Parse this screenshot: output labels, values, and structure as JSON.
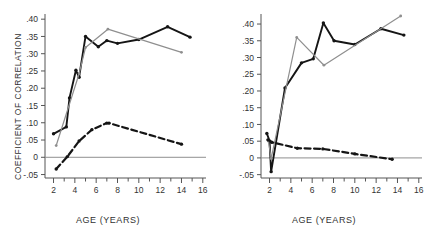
{
  "figure": {
    "panels": [
      {
        "id": "left",
        "name": "left-panel",
        "xlabel": "AGE (YEARS)",
        "ylabel": "COEFFICIENT OF CORRELATION",
        "xticks": [
          2,
          4,
          6,
          8,
          10,
          12,
          14,
          16
        ],
        "xtick_labels": [
          "2",
          "4",
          "6",
          "8",
          "10",
          "12",
          "14",
          "16"
        ],
        "yticks": [
          -0.05,
          0,
          0.05,
          0.1,
          0.15,
          0.2,
          0.25,
          0.3,
          0.35,
          0.4
        ],
        "ytick_labels": [
          "-.05",
          "0",
          ".05",
          ".10",
          ".15",
          ".20",
          ".25",
          ".30",
          ".35",
          ".40"
        ],
        "xlim": [
          1.2,
          16.3
        ],
        "ylim": [
          -0.06,
          0.415
        ]
      },
      {
        "id": "right",
        "name": "right-panel",
        "xlabel": "AGE (YEARS)",
        "ylabel": "",
        "xticks": [
          2,
          4,
          6,
          8,
          10,
          12,
          14,
          16
        ],
        "xtick_labels": [
          "2",
          "4",
          "6",
          "8",
          "10",
          "12",
          "14",
          "16"
        ],
        "yticks": [
          -0.05,
          0,
          0.05,
          0.1,
          0.15,
          0.2,
          0.25,
          0.3,
          0.35,
          0.4
        ],
        "ytick_labels": [
          "-.05",
          "0",
          ".05",
          ".10",
          ".15",
          ".20",
          ".25",
          ".30",
          ".35",
          ".40"
        ],
        "xlim": [
          1.2,
          16.3
        ],
        "ylim": [
          -0.06,
          0.43
        ]
      }
    ]
  },
  "chart_data": [
    {
      "type": "line",
      "panel": "left",
      "title": "",
      "xlabel": "AGE (YEARS)",
      "ylabel": "COEFFICIENT OF CORRELATION",
      "xlim": [
        1.2,
        16.3
      ],
      "ylim": [
        -0.06,
        0.415
      ],
      "grid": false,
      "legend": "none",
      "zero_line": true,
      "series": [
        {
          "name": "black-solid",
          "style": "solid",
          "color": "#151515",
          "markers": true,
          "x": [
            2.0,
            3.2,
            3.5,
            4.1,
            4.4,
            5.0,
            6.2,
            7.0,
            8.0,
            10.0,
            12.7,
            14.8
          ],
          "y": [
            0.068,
            0.088,
            0.172,
            0.252,
            0.232,
            0.35,
            0.32,
            0.338,
            0.33,
            0.341,
            0.378,
            0.348
          ]
        },
        {
          "name": "gray-solid",
          "style": "solid",
          "color": "#8f8f8f",
          "markers": true,
          "x": [
            2.25,
            4.4,
            5.0,
            7.1,
            14.0
          ],
          "y": [
            0.034,
            0.242,
            0.318,
            0.371,
            0.304
          ]
        },
        {
          "name": "black-dashed",
          "style": "dashed",
          "color": "#151515",
          "markers": true,
          "x": [
            2.25,
            3.3,
            4.4,
            5.6,
            7.0,
            7.2,
            14.0
          ],
          "y": [
            -0.034,
            0.002,
            0.047,
            0.08,
            0.099,
            0.099,
            0.038
          ]
        }
      ]
    },
    {
      "type": "line",
      "panel": "right",
      "title": "",
      "xlabel": "AGE (YEARS)",
      "ylabel": "",
      "xlim": [
        1.2,
        16.3
      ],
      "ylim": [
        -0.06,
        0.43
      ],
      "grid": false,
      "legend": "none",
      "zero_line": true,
      "series": [
        {
          "name": "black-solid",
          "style": "solid",
          "color": "#151515",
          "markers": true,
          "x": [
            1.75,
            2.0,
            2.15,
            3.45,
            5.0,
            6.1,
            7.05,
            8.05,
            10.0,
            12.45,
            14.6
          ],
          "y": [
            0.073,
            0.051,
            -0.041,
            0.209,
            0.284,
            0.296,
            0.403,
            0.35,
            0.339,
            0.386,
            0.367
          ]
        },
        {
          "name": "gray-solid",
          "style": "solid",
          "color": "#8f8f8f",
          "markers": true,
          "x": [
            1.9,
            2.15,
            4.55,
            7.1,
            14.3
          ],
          "y": [
            0.05,
            -0.002,
            0.36,
            0.277,
            0.424
          ]
        },
        {
          "name": "black-dashed",
          "style": "dashed",
          "color": "#151515",
          "markers": true,
          "x": [
            1.85,
            2.2,
            4.6,
            7.0,
            10.0,
            13.5
          ],
          "y": [
            0.054,
            0.047,
            0.029,
            0.027,
            0.012,
            -0.004
          ]
        }
      ]
    }
  ]
}
